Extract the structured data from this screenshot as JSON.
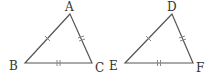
{
  "figure": {
    "triangles": [
      {
        "name": "ABC",
        "vertices": [
          {
            "label": "A",
            "x": 70,
            "y": 14,
            "label_x": 65,
            "label_y": 11
          },
          {
            "label": "B",
            "x": 25,
            "y": 63,
            "label_x": 9,
            "label_y": 70
          },
          {
            "label": "C",
            "x": 92,
            "y": 63,
            "label_x": 95,
            "label_y": 72
          }
        ]
      },
      {
        "name": "DEF",
        "vertices": [
          {
            "label": "D",
            "x": 172,
            "y": 14,
            "label_x": 167,
            "label_y": 11
          },
          {
            "label": "E",
            "x": 125,
            "y": 63,
            "label_x": 109,
            "label_y": 70
          },
          {
            "label": "F",
            "x": 193,
            "y": 63,
            "label_x": 196,
            "label_y": 72
          }
        ]
      }
    ],
    "tick_marks": {
      "AB": "single",
      "AC": "double",
      "BC": "double",
      "DE": "single",
      "DF": "double",
      "EF": "double"
    },
    "colors": {
      "edge": "#555555",
      "tick": "#888888",
      "label": "#333333",
      "background": "#ffffff"
    }
  }
}
